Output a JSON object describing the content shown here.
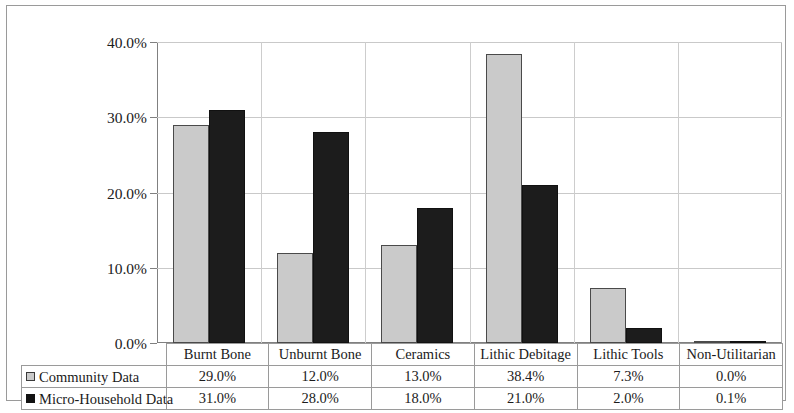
{
  "chart_data": {
    "type": "bar",
    "title": "",
    "xlabel": "",
    "ylabel": "",
    "ylim": [
      0,
      40
    ],
    "ytick_labels": [
      "0.0%",
      "10.0%",
      "20.0%",
      "30.0%",
      "40.0%"
    ],
    "ytick_values": [
      0,
      10,
      20,
      30,
      40
    ],
    "grid": true,
    "legend_position": "bottom-left-table",
    "categories": [
      "Burnt Bone",
      "Unburnt Bone",
      "Ceramics",
      "Lithic Debitage",
      "Lithic Tools",
      "Non-Utilitarian"
    ],
    "series": [
      {
        "name": "Community Data",
        "color": "#cacaca",
        "values": [
          29.0,
          12.0,
          13.0,
          38.4,
          7.3,
          0.0
        ],
        "labels": [
          "29.0%",
          "12.0%",
          "13.0%",
          "38.4%",
          "7.3%",
          "0.0%"
        ]
      },
      {
        "name": "Micro-Household Data",
        "color": "#1c1c1c",
        "values": [
          31.0,
          28.0,
          18.0,
          21.0,
          2.0,
          0.1
        ],
        "labels": [
          "31.0%",
          "28.0%",
          "18.0%",
          "21.0%",
          "2.0%",
          "0.1%"
        ]
      }
    ]
  }
}
